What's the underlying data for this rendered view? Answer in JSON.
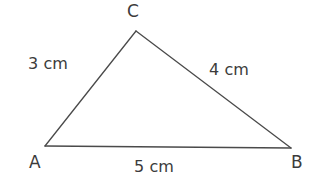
{
  "figure": {
    "kind": "triangle-diagram",
    "background_color": "#ffffff",
    "stroke_color": "#4a4a4a",
    "text_color": "#3b3b3b",
    "vertices": [
      {
        "name": "A",
        "label": "A",
        "x": 45,
        "y": 146
      },
      {
        "name": "B",
        "label": "B",
        "x": 291,
        "y": 148
      },
      {
        "name": "C",
        "label": "C",
        "x": 136,
        "y": 31
      }
    ],
    "sides": [
      {
        "name": "AC",
        "label": "3 cm",
        "length": 3,
        "unit": "cm"
      },
      {
        "name": "CB",
        "label": "4 cm",
        "length": 4,
        "unit": "cm"
      },
      {
        "name": "AB",
        "label": "5 cm",
        "length": 5,
        "unit": "cm"
      }
    ]
  },
  "chart_data": {
    "type": "diagram",
    "title": "",
    "shape": "triangle",
    "vertex_labels": [
      "A",
      "B",
      "C"
    ],
    "side_labels": [
      "3 cm",
      "4 cm",
      "5 cm"
    ],
    "side_lengths": [
      3,
      4,
      5
    ],
    "unit": "cm",
    "edges": [
      {
        "from": "A",
        "to": "C",
        "label": "3 cm"
      },
      {
        "from": "C",
        "to": "B",
        "label": "4 cm"
      },
      {
        "from": "A",
        "to": "B",
        "label": "5 cm"
      }
    ]
  }
}
